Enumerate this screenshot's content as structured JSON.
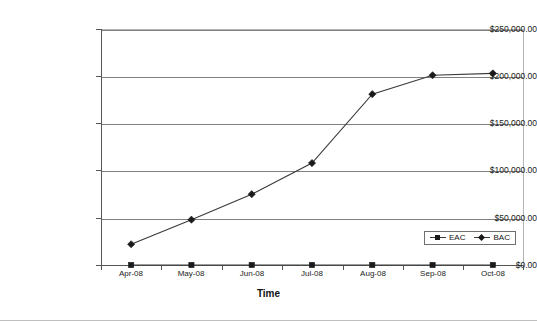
{
  "chart_data": {
    "type": "line",
    "title": "",
    "xlabel": "Time",
    "ylabel": "",
    "categories": [
      "Apr-08",
      "May-08",
      "Jun-08",
      "Jul-08",
      "Aug-08",
      "Sep-08",
      "Oct-08"
    ],
    "series": [
      {
        "name": "EAC",
        "marker": "square",
        "values": [
          0,
          0,
          0,
          0,
          0,
          0,
          0
        ]
      },
      {
        "name": "BAC",
        "marker": "diamond",
        "values": [
          22000,
          48000,
          75000,
          108000,
          181000,
          201000,
          203000
        ]
      }
    ],
    "ylim": [
      0,
      250000
    ],
    "yticks": [
      0,
      50000,
      100000,
      150000,
      200000,
      250000
    ],
    "ytick_labels": [
      "$0.00",
      "$50,000.00",
      "$100,000.00",
      "$150,000.00",
      "$200,000.00",
      "$250,000.00"
    ],
    "grid": true,
    "legend_position": "inside-bottom-right",
    "colors": {
      "line": "#3a3a3a",
      "marker": "#1a1a1a",
      "gridline": "#808080",
      "axis": "#555555",
      "plot_border": "#b5b5b5",
      "text": "#1a1a1a",
      "background": "#ffffff"
    }
  },
  "legend": {
    "entries": [
      {
        "label": "EAC"
      },
      {
        "label": "BAC"
      }
    ]
  }
}
